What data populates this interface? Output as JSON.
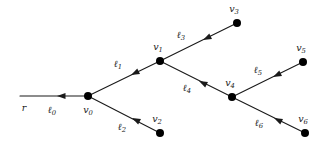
{
  "figure": {
    "type": "directed-tree-diagram",
    "width": 325,
    "height": 144,
    "background": "#ffffff",
    "stroke_color": "#1a1a1a",
    "node_color": "#000000",
    "node_radius": 4.0,
    "line_width": 1.1
  },
  "nodes": [
    {
      "id": "v0",
      "label": "v",
      "sub": "0",
      "x": 88,
      "y": 96,
      "label_x": 88,
      "label_y": 110,
      "dot": true
    },
    {
      "id": "v1",
      "label": "v",
      "sub": "1",
      "x": 160,
      "y": 61,
      "label_x": 158,
      "label_y": 47,
      "dot": true
    },
    {
      "id": "v2",
      "label": "v",
      "sub": "2",
      "x": 160,
      "y": 133,
      "label_x": 157,
      "label_y": 119,
      "dot": true
    },
    {
      "id": "v3",
      "label": "v",
      "sub": "3",
      "x": 237,
      "y": 23,
      "label_x": 234,
      "label_y": 9,
      "dot": true
    },
    {
      "id": "v4",
      "label": "v",
      "sub": "4",
      "x": 232,
      "y": 97,
      "label_x": 230,
      "label_y": 83,
      "dot": true
    },
    {
      "id": "v5",
      "label": "v",
      "sub": "5",
      "x": 303,
      "y": 62,
      "label_x": 301,
      "label_y": 48,
      "dot": true
    },
    {
      "id": "v6",
      "label": "v",
      "sub": "6",
      "x": 305,
      "y": 133,
      "label_x": 303,
      "label_y": 119,
      "dot": true
    }
  ],
  "root_label": {
    "text": "r",
    "x": 24,
    "y": 108
  },
  "edges": [
    {
      "id": "l0",
      "label": "ℓ",
      "sub": "0",
      "from": "root-stub",
      "to": "v0",
      "x1": 20,
      "y1": 96,
      "x2": 88,
      "y2": 96,
      "arrow_x": 57,
      "arrow_y": 96,
      "arrow_angle": 180,
      "label_x": 52,
      "label_y": 110
    },
    {
      "id": "l1",
      "label": "ℓ",
      "sub": "1",
      "from": "v1",
      "to": "v0",
      "x1": 160,
      "y1": 61,
      "x2": 88,
      "y2": 96,
      "arrow_x": 131,
      "arrow_y": 75,
      "arrow_angle": 154,
      "label_x": 118,
      "label_y": 64
    },
    {
      "id": "l2",
      "label": "ℓ",
      "sub": "2",
      "from": "v2",
      "to": "v0",
      "x1": 160,
      "y1": 133,
      "x2": 88,
      "y2": 96,
      "arrow_x": 132,
      "arrow_y": 118,
      "arrow_angle": 207,
      "label_x": 122,
      "label_y": 127
    },
    {
      "id": "l3",
      "label": "ℓ",
      "sub": "3",
      "from": "v3",
      "to": "v1",
      "x1": 237,
      "y1": 23,
      "x2": 160,
      "y2": 61,
      "arrow_x": 203,
      "arrow_y": 40,
      "arrow_angle": 154,
      "label_x": 181,
      "label_y": 35
    },
    {
      "id": "l4",
      "label": "ℓ",
      "sub": "4",
      "from": "v4",
      "to": "v1",
      "x1": 232,
      "y1": 97,
      "x2": 160,
      "y2": 61,
      "arrow_x": 199,
      "arrow_y": 81,
      "arrow_angle": 207,
      "label_x": 187,
      "label_y": 88
    },
    {
      "id": "l5",
      "label": "ℓ",
      "sub": "5",
      "from": "v5",
      "to": "v4",
      "x1": 303,
      "y1": 62,
      "x2": 232,
      "y2": 97,
      "arrow_x": 273,
      "arrow_y": 77,
      "arrow_angle": 154,
      "label_x": 258,
      "label_y": 70
    },
    {
      "id": "l6",
      "label": "ℓ",
      "sub": "6",
      "from": "v6",
      "to": "v4",
      "x1": 305,
      "y1": 133,
      "x2": 232,
      "y2": 97,
      "arrow_x": 274,
      "arrow_y": 118,
      "arrow_angle": 206,
      "label_x": 259,
      "label_y": 123
    }
  ]
}
